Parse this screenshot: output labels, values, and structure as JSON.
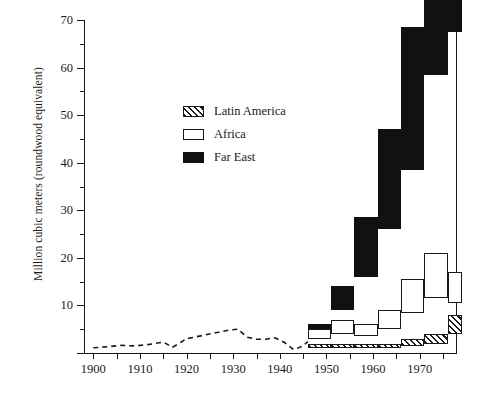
{
  "chart_data": {
    "type": "bar",
    "title": "",
    "subtitle": "",
    "xlabel": "",
    "ylabel": "Million cubic meters (roundwood equivalent)",
    "xlim": [
      1898,
      1978
    ],
    "ylim": [
      0,
      70
    ],
    "grid": false,
    "stacked": true,
    "legend_position": "upper-left-inside",
    "y_ticks_major": [
      0,
      10,
      20,
      30,
      40,
      50,
      60,
      70
    ],
    "y_ticks_minor": [
      5,
      15,
      25,
      35,
      45,
      55,
      65
    ],
    "y_tick_labels": [
      "10",
      "20",
      "30",
      "40",
      "50",
      "60",
      "70"
    ],
    "x_ticks_major": [
      1900,
      1910,
      1920,
      1930,
      1940,
      1950,
      1960,
      1970
    ],
    "x_ticks_minor": [
      1905,
      1915,
      1925,
      1935,
      1945,
      1955,
      1965,
      1975
    ],
    "x_tick_labels": [
      "1900",
      "1910",
      "1920",
      "1930",
      "1940",
      "1950",
      "1960",
      "1970"
    ],
    "categories": [
      "1946-50",
      "1951-55",
      "1956-60",
      "1961-65",
      "1966-70",
      "1971-75",
      "1976-78"
    ],
    "category_starts": [
      1946,
      1951,
      1956,
      1961,
      1966,
      1971,
      1976
    ],
    "category_ends": [
      1951,
      1956,
      1961,
      1966,
      1971,
      1976,
      1979
    ],
    "series": [
      {
        "name": "Far East",
        "color": "#111111",
        "pattern": "solid",
        "values": [
          1.5,
          5.0,
          12.5,
          21.0,
          30.0,
          47.0,
          57.0
        ]
      },
      {
        "name": "Africa",
        "color": "#ffffff",
        "pattern": "open",
        "values": [
          2.0,
          3.0,
          2.5,
          4.0,
          7.0,
          9.5,
          6.5
        ]
      },
      {
        "name": "Latin America",
        "color": "#ffffff",
        "pattern": "hatch",
        "values": [
          1.0,
          1.0,
          1.0,
          1.0,
          1.5,
          2.0,
          4.0
        ]
      }
    ],
    "totals": [
      4.5,
      9.0,
      16.0,
      26.0,
      38.5,
      58.5,
      67.5
    ],
    "line_series": {
      "name": "pre-war trade",
      "style": "dashed",
      "x": [
        1900,
        1903,
        1906,
        1909,
        1912,
        1915,
        1917,
        1920,
        1923,
        1926,
        1929,
        1931,
        1933,
        1935,
        1937,
        1939,
        1941,
        1943,
        1945,
        1946
      ],
      "y": [
        1.1,
        1.3,
        1.6,
        1.5,
        1.8,
        2.3,
        1.2,
        3.0,
        3.6,
        4.2,
        4.8,
        5.0,
        3.3,
        2.9,
        2.9,
        3.2,
        2.2,
        0.7,
        1.5,
        2.4
      ]
    }
  },
  "legend": {
    "items": [
      {
        "label": "Latin America",
        "swatch": "hatch"
      },
      {
        "label": "Africa",
        "swatch": "open"
      },
      {
        "label": "Far East",
        "swatch": "solid"
      }
    ]
  }
}
